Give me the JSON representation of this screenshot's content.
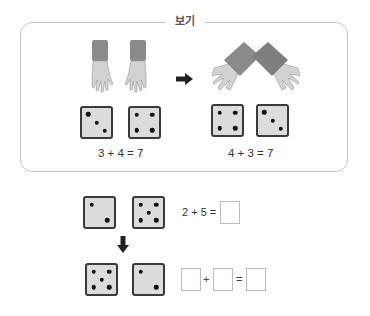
{
  "example": {
    "title": "보기",
    "arrow_icon": "right-arrow-icon",
    "left_equation": "3 + 4 = 7",
    "right_equation": "4 + 3 = 7",
    "left_dice": [
      3,
      4
    ],
    "right_dice": [
      4,
      3
    ]
  },
  "problem": {
    "top_dice": [
      2,
      5
    ],
    "top_equation": "2 + 5 =",
    "down_arrow_icon": "down-arrow-icon",
    "bottom_dice": [
      5,
      2
    ],
    "plus": "+",
    "equals": "="
  },
  "colors": {
    "die_fill": "#dcdcdc",
    "die_border": "#3a3a3a",
    "cuff": "#8a8a8a",
    "hand": "#d2d2d2",
    "box_border": "#c4c4c4"
  }
}
